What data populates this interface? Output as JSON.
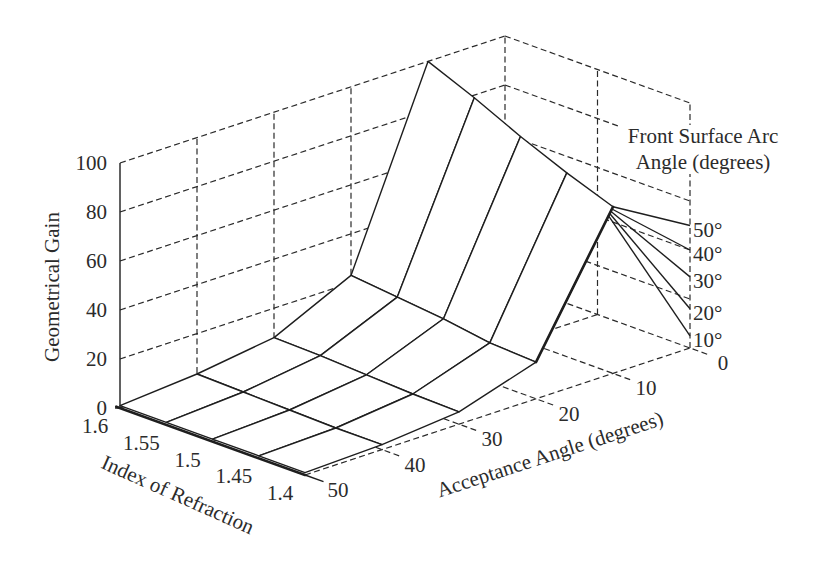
{
  "chart_data": {
    "type": "line",
    "projection": "3d-wireframe-surface",
    "title": "",
    "xlabel": "Index of Refraction",
    "ylabel": "Acceptance Angle (degrees)",
    "zlabel": "Geometrical Gain",
    "grid": true,
    "x_axis": {
      "label": "Index of Refraction",
      "values": [
        1.6,
        1.55,
        1.5,
        1.45,
        1.4
      ],
      "tick_labels": [
        "1.6",
        "1.55",
        "1.5",
        "1.45",
        "1.4"
      ]
    },
    "y_axis": {
      "label": "Acceptance Angle (degrees)",
      "values": [
        50,
        40,
        30,
        20,
        10,
        0
      ],
      "tick_labels": [
        "50",
        "40",
        "30",
        "20",
        "10",
        "0"
      ]
    },
    "z_axis": {
      "label": "Geometrical Gain",
      "range": [
        0,
        100
      ],
      "ticks": [
        0,
        20,
        40,
        60,
        80,
        100
      ],
      "tick_labels": [
        "0",
        "20",
        "40",
        "60",
        "80",
        "100"
      ]
    },
    "categories": [
      50,
      40,
      30,
      20,
      10
    ],
    "series": [
      {
        "name": "1.6",
        "values": [
          1,
          3.5,
          8,
          23,
          100
        ]
      },
      {
        "name": "1.55",
        "values": [
          1,
          3,
          7.5,
          21,
          92
        ]
      },
      {
        "name": "1.5",
        "values": [
          1,
          2.5,
          6.5,
          19,
          83
        ]
      },
      {
        "name": "1.45",
        "values": [
          1,
          2,
          5.5,
          16,
          75
        ]
      },
      {
        "name": "1.4",
        "values": [
          1,
          2,
          5,
          15,
          68
        ]
      }
    ],
    "front_surface_arc_angle": {
      "title_line1": "Front Surface Arc",
      "title_line2": "Angle (degrees)",
      "from": {
        "index": 1.4,
        "acceptance_angle": 10,
        "gain": 68
      },
      "to": {
        "index": 1.4,
        "acceptance_angle": 0
      },
      "lines": [
        {
          "label": "10°",
          "angle": 10,
          "gain": 5
        },
        {
          "label": "20°",
          "angle": 20,
          "gain": 16
        },
        {
          "label": "30°",
          "angle": 30,
          "gain": 29
        },
        {
          "label": "40°",
          "angle": 40,
          "gain": 40
        },
        {
          "label": "50°",
          "angle": 50,
          "gain": 50
        }
      ]
    }
  }
}
